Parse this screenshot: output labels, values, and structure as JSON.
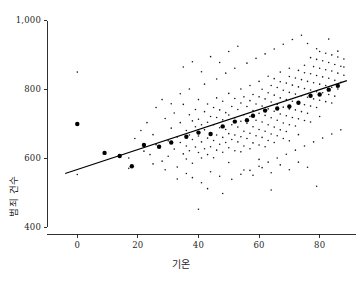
{
  "figure": {
    "background": "#ffffff",
    "foreground": "#1a1a1a",
    "caption": ""
  },
  "axis": {
    "y_title": "범죄 건수",
    "x_title": "기온",
    "y_ticks": [
      "400",
      "600",
      "800",
      "1,000"
    ],
    "x_ticks": [
      "0",
      "20",
      "40",
      "60",
      "80"
    ]
  },
  "chart_data": {
    "type": "scatter",
    "title": "",
    "xlabel": "기온",
    "ylabel": "범죄 건수",
    "xlim": [
      -10,
      92
    ],
    "ylim": [
      380,
      1020
    ],
    "xticks": [
      0,
      20,
      40,
      60,
      80
    ],
    "yticks": [
      400,
      600,
      800,
      1000
    ],
    "xticklabels": [
      "0",
      "20",
      "40",
      "60",
      "80"
    ],
    "yticklabels": [
      "400",
      "600",
      "800",
      "1,000"
    ],
    "grid": false,
    "legend": null,
    "series": [
      {
        "name": "관측치",
        "type": "scatter",
        "marker": "dot",
        "marker_size": 1.6,
        "color": "#1a1a1a",
        "points": [
          [
            0,
            851
          ],
          [
            0,
            553
          ],
          [
            17,
            601
          ],
          [
            17,
            571
          ],
          [
            22,
            621
          ],
          [
            24,
            611
          ],
          [
            25,
            669
          ],
          [
            26,
            640
          ],
          [
            28,
            592
          ],
          [
            29,
            716
          ],
          [
            30,
            651
          ],
          [
            30,
            606
          ],
          [
            31,
            688
          ],
          [
            32,
            732
          ],
          [
            32,
            627
          ],
          [
            33,
            662
          ],
          [
            33,
            575
          ],
          [
            34,
            704
          ],
          [
            34,
            646
          ],
          [
            35,
            613
          ],
          [
            35,
            757
          ],
          [
            36,
            681
          ],
          [
            36,
            636
          ],
          [
            36,
            598
          ],
          [
            37,
            727
          ],
          [
            37,
            668
          ],
          [
            37,
            622
          ],
          [
            38,
            709
          ],
          [
            38,
            655
          ],
          [
            38,
            586
          ],
          [
            39,
            742
          ],
          [
            39,
            692
          ],
          [
            39,
            633
          ],
          [
            40,
            771
          ],
          [
            40,
            714
          ],
          [
            40,
            665
          ],
          [
            40,
            617
          ],
          [
            40,
            452
          ],
          [
            41,
            698
          ],
          [
            41,
            648
          ],
          [
            41,
            601
          ],
          [
            42,
            736
          ],
          [
            42,
            683
          ],
          [
            42,
            628
          ],
          [
            43,
            758
          ],
          [
            43,
            705
          ],
          [
            43,
            659
          ],
          [
            43,
            611
          ],
          [
            44,
            722
          ],
          [
            44,
            671
          ],
          [
            44,
            634
          ],
          [
            45,
            748
          ],
          [
            45,
            698
          ],
          [
            45,
            652
          ],
          [
            45,
            602
          ],
          [
            46,
            776
          ],
          [
            46,
            719
          ],
          [
            46,
            668
          ],
          [
            46,
            624
          ],
          [
            47,
            741
          ],
          [
            47,
            689
          ],
          [
            47,
            641
          ],
          [
            48,
            766
          ],
          [
            48,
            712
          ],
          [
            48,
            661
          ],
          [
            48,
            618
          ],
          [
            49,
            733
          ],
          [
            49,
            684
          ],
          [
            49,
            646
          ],
          [
            50,
            789
          ],
          [
            50,
            726
          ],
          [
            50,
            672
          ],
          [
            50,
            631
          ],
          [
            50,
            588
          ],
          [
            51,
            751
          ],
          [
            51,
            698
          ],
          [
            51,
            655
          ],
          [
            52,
            774
          ],
          [
            52,
            718
          ],
          [
            52,
            668
          ],
          [
            52,
            622
          ],
          [
            53,
            742
          ],
          [
            53,
            691
          ],
          [
            53,
            648
          ],
          [
            54,
            802
          ],
          [
            54,
            761
          ],
          [
            54,
            708
          ],
          [
            54,
            663
          ],
          [
            54,
            619
          ],
          [
            55,
            779
          ],
          [
            55,
            727
          ],
          [
            55,
            679
          ],
          [
            55,
            636
          ],
          [
            56,
            751
          ],
          [
            56,
            702
          ],
          [
            56,
            658
          ],
          [
            57,
            812
          ],
          [
            57,
            768
          ],
          [
            57,
            722
          ],
          [
            57,
            673
          ],
          [
            57,
            628
          ],
          [
            58,
            786
          ],
          [
            58,
            739
          ],
          [
            58,
            692
          ],
          [
            58,
            645
          ],
          [
            59,
            758
          ],
          [
            59,
            711
          ],
          [
            59,
            666
          ],
          [
            60,
            824
          ],
          [
            60,
            779
          ],
          [
            60,
            731
          ],
          [
            60,
            684
          ],
          [
            60,
            639
          ],
          [
            60,
            597
          ],
          [
            61,
            801
          ],
          [
            61,
            752
          ],
          [
            61,
            706
          ],
          [
            61,
            661
          ],
          [
            62,
            773
          ],
          [
            62,
            725
          ],
          [
            62,
            679
          ],
          [
            62,
            634
          ],
          [
            63,
            839
          ],
          [
            63,
            791
          ],
          [
            63,
            744
          ],
          [
            63,
            698
          ],
          [
            63,
            652
          ],
          [
            64,
            812
          ],
          [
            64,
            764
          ],
          [
            64,
            718
          ],
          [
            64,
            671
          ],
          [
            65,
            832
          ],
          [
            65,
            784
          ],
          [
            65,
            737
          ],
          [
            65,
            691
          ],
          [
            65,
            646
          ],
          [
            66,
            806
          ],
          [
            66,
            757
          ],
          [
            66,
            711
          ],
          [
            66,
            666
          ],
          [
            67,
            851
          ],
          [
            67,
            823
          ],
          [
            67,
            776
          ],
          [
            67,
            729
          ],
          [
            67,
            683
          ],
          [
            68,
            798
          ],
          [
            68,
            749
          ],
          [
            68,
            703
          ],
          [
            68,
            658
          ],
          [
            69,
            819
          ],
          [
            69,
            771
          ],
          [
            69,
            724
          ],
          [
            69,
            678
          ],
          [
            70,
            862
          ],
          [
            70,
            838
          ],
          [
            70,
            792
          ],
          [
            70,
            744
          ],
          [
            70,
            698
          ],
          [
            70,
            651
          ],
          [
            71,
            813
          ],
          [
            71,
            766
          ],
          [
            71,
            719
          ],
          [
            72,
            834
          ],
          [
            72,
            787
          ],
          [
            72,
            741
          ],
          [
            72,
            694
          ],
          [
            73,
            856
          ],
          [
            73,
            808
          ],
          [
            73,
            761
          ],
          [
            73,
            715
          ],
          [
            73,
            669
          ],
          [
            74,
            829
          ],
          [
            74,
            782
          ],
          [
            74,
            736
          ],
          [
            75,
            871
          ],
          [
            75,
            849
          ],
          [
            75,
            803
          ],
          [
            75,
            756
          ],
          [
            75,
            710
          ],
          [
            76,
            824
          ],
          [
            76,
            778
          ],
          [
            76,
            731
          ],
          [
            77,
            893
          ],
          [
            77,
            846
          ],
          [
            77,
            799
          ],
          [
            77,
            752
          ],
          [
            77,
            706
          ],
          [
            78,
            867
          ],
          [
            78,
            820
          ],
          [
            78,
            773
          ],
          [
            79,
            888
          ],
          [
            79,
            841
          ],
          [
            79,
            794
          ],
          [
            79,
            748
          ],
          [
            80,
            911
          ],
          [
            80,
            862
          ],
          [
            80,
            816
          ],
          [
            80,
            769
          ],
          [
            80,
            722
          ],
          [
            81,
            884
          ],
          [
            81,
            837
          ],
          [
            81,
            791
          ],
          [
            82,
            906
          ],
          [
            82,
            858
          ],
          [
            82,
            812
          ],
          [
            82,
            765
          ],
          [
            83,
            879
          ],
          [
            83,
            833
          ],
          [
            83,
            786
          ],
          [
            84,
            901
          ],
          [
            84,
            854
          ],
          [
            84,
            807
          ],
          [
            84,
            761
          ],
          [
            85,
            873
          ],
          [
            85,
            827
          ],
          [
            85,
            781
          ],
          [
            86,
            895
          ],
          [
            86,
            848
          ],
          [
            86,
            802
          ],
          [
            87,
            868
          ],
          [
            87,
            821
          ],
          [
            88,
            889
          ],
          [
            88,
            842
          ],
          [
            44,
            561
          ],
          [
            47,
            548
          ],
          [
            51,
            539
          ],
          [
            55,
            566
          ],
          [
            58,
            551
          ],
          [
            61,
            573
          ],
          [
            64,
            558
          ],
          [
            67,
            581
          ],
          [
            70,
            567
          ],
          [
            73,
            589
          ],
          [
            76,
            574
          ],
          [
            33,
            540
          ],
          [
            36,
            556
          ],
          [
            29,
            567
          ],
          [
            25,
            584
          ],
          [
            41,
            529
          ],
          [
            38,
            544
          ],
          [
            69,
            612
          ],
          [
            72,
            624
          ],
          [
            75,
            636
          ],
          [
            78,
            648
          ],
          [
            81,
            659
          ],
          [
            84,
            671
          ],
          [
            87,
            683
          ],
          [
            66,
            601
          ],
          [
            63,
            589
          ],
          [
            60,
            577
          ],
          [
            57,
            565
          ],
          [
            54,
            554
          ],
          [
            26,
            748
          ],
          [
            28,
            771
          ],
          [
            31,
            759
          ],
          [
            34,
            788
          ],
          [
            37,
            802
          ],
          [
            42,
            816
          ],
          [
            46,
            831
          ],
          [
            49,
            848
          ],
          [
            52,
            862
          ],
          [
            56,
            877
          ],
          [
            59,
            891
          ],
          [
            62,
            904
          ],
          [
            65,
            918
          ],
          [
            68,
            932
          ],
          [
            71,
            946
          ],
          [
            74,
            958
          ],
          [
            76,
            934
          ],
          [
            79,
            919
          ],
          [
            83,
            947
          ],
          [
            86,
            912
          ],
          [
            88,
            866
          ],
          [
            23,
            704
          ],
          [
            21,
            681
          ],
          [
            19,
            658
          ],
          [
            44,
            896
          ],
          [
            47,
            879
          ],
          [
            50,
            911
          ],
          [
            53,
            926
          ],
          [
            43,
            512
          ],
          [
            48,
            498
          ],
          [
            64,
            508
          ],
          [
            79,
            519
          ],
          [
            35,
            866
          ],
          [
            38,
            881
          ],
          [
            41,
            852
          ]
        ]
      },
      {
        "name": "구간 평균",
        "type": "scatter",
        "marker": "dot-large",
        "marker_size": 4.4,
        "color": "#000000",
        "points": [
          [
            0,
            700
          ],
          [
            9,
            616
          ],
          [
            14,
            607
          ],
          [
            18,
            577
          ],
          [
            22,
            639
          ],
          [
            27,
            634
          ],
          [
            31,
            646
          ],
          [
            36,
            663
          ],
          [
            40,
            675
          ],
          [
            44,
            671
          ],
          [
            48,
            693
          ],
          [
            52,
            707
          ],
          [
            56,
            711
          ],
          [
            58,
            724
          ],
          [
            62,
            739
          ],
          [
            66,
            745
          ],
          [
            70,
            751
          ],
          [
            73,
            762
          ],
          [
            77,
            782
          ],
          [
            80,
            786
          ],
          [
            83,
            800
          ],
          [
            86,
            811
          ]
        ]
      }
    ],
    "fit_line": {
      "name": "회귀선",
      "type": "line",
      "color": "#000000",
      "width": 1.2,
      "x0": -4,
      "y0": 556,
      "x1": 89,
      "y1": 826
    }
  }
}
